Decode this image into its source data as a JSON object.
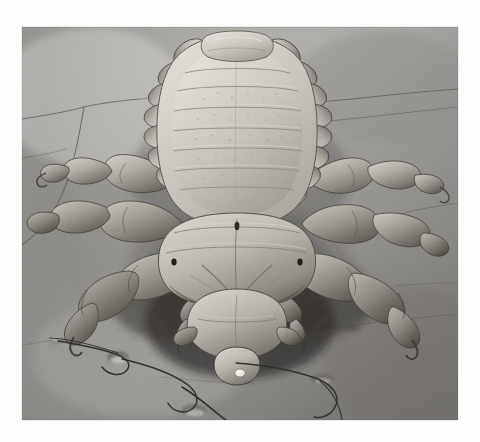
{
  "page": {
    "background_color": "#fdfdfd",
    "width": 480,
    "height": 442,
    "alt_text": "Scanning electron micrograph of a head louse clinging to human skin"
  },
  "plate": {
    "type": "photograph",
    "technique": "scanning electron micrograph",
    "subject": "head louse (Pediculus humanus capitis)",
    "view": "dorsal view, head toward bottom of frame",
    "substrate": "human skin surface with furrows, follicle openings and hair shafts",
    "color_mode": "grayscale",
    "x": 22,
    "y": 27,
    "width": 436,
    "height": 393,
    "tones": {
      "highlight": "#e2e0dc",
      "skin_light": "#c6c4c0",
      "skin_mid": "#9a9896",
      "skin_dark": "#6f6e6c",
      "shadow": "#2c2b2a",
      "deep_shadow": "#151515",
      "specimen_light": "#d8d5cf",
      "specimen_mid": "#a6a29b",
      "specimen_dark": "#55524d"
    },
    "features": [
      {
        "name": "abdomen",
        "note": "segmented, nine pleural lobes each side, transverse banding"
      },
      {
        "name": "thorax",
        "note": "broad fused plate bearing three pairs of legs"
      },
      {
        "name": "head",
        "note": "conical, with short antennae and piercing mouthparts"
      },
      {
        "name": "legs",
        "note": "six legs, each ending in a single tarsal claw"
      },
      {
        "name": "skin-furrows",
        "note": "polygonal crease lines across the epidermis"
      },
      {
        "name": "hair-shafts",
        "note": "three fine hairs emerging from follicles"
      },
      {
        "name": "follicle-openings",
        "note": "small pits on skin surface"
      }
    ]
  }
}
